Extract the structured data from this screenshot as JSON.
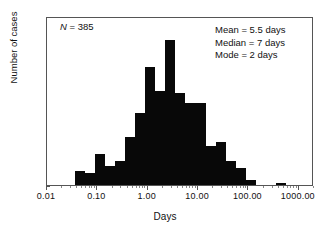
{
  "chart_data": {
    "type": "bar",
    "title": "",
    "subtitle": "",
    "xlabel": "Days",
    "ylabel": "Number of cases",
    "xscale": "log",
    "xlim": [
      0.01,
      2000
    ],
    "ylim": [
      0,
      70
    ],
    "grid": false,
    "legend": null,
    "bar_color": "#080808",
    "x_tick_labels": [
      "0.01",
      "0.10",
      "1.00",
      "10.00",
      "100.00",
      "1000.00"
    ],
    "x_tick_values": [
      0.01,
      0.1,
      1,
      10,
      100,
      1000
    ],
    "y_tick_labels": [
      "0",
      "10",
      "20",
      "30",
      "40",
      "50",
      "60",
      "70"
    ],
    "y_tick_values": [
      0,
      10,
      20,
      30,
      40,
      50,
      60,
      70
    ],
    "bin_edges_days": [
      0.0355,
      0.056,
      0.089,
      0.141,
      0.224,
      0.355,
      0.562,
      0.891,
      1.41,
      2.24,
      3.55,
      5.62,
      8.91,
      14.1,
      22.4,
      35.5,
      56.2,
      89.1,
      141,
      224,
      355,
      562,
      891,
      1410
    ],
    "values": [
      6,
      5,
      13,
      8,
      10,
      20,
      30,
      49,
      39,
      60,
      38,
      34,
      34,
      16,
      18,
      10,
      7,
      2,
      0,
      0,
      1
    ],
    "categories": [
      "0.036-0.056",
      "0.056-0.089",
      "0.089-0.141",
      "0.141-0.224",
      "0.224-0.355",
      "0.355-0.562",
      "0.562-0.891",
      "0.891-1.41",
      "1.41-2.24",
      "2.24-3.55",
      "3.55-5.62",
      "5.62-8.91",
      "8.91-14.1",
      "14.1-22.4",
      "22.4-35.5",
      "35.5-56.2",
      "56.2-89.1",
      "89.1-141",
      "141-224",
      "224-355",
      "355-562"
    ],
    "annotations": [
      {
        "id": "sample-size",
        "text": "N = 385"
      },
      {
        "id": "mean",
        "text": "Mean = 5.5 days"
      },
      {
        "id": "median",
        "text": "Median = 7 days"
      },
      {
        "id": "mode",
        "text": "Mode = 2 days"
      }
    ]
  },
  "annotations": {
    "n_symbol": "N",
    "n_value": " = 385",
    "mean": "Mean = 5.5 days",
    "median": "Median = 7 days",
    "mode": "Mode = 2 days"
  },
  "axes": {
    "x_title": "Days",
    "y_title": "Number of cases"
  }
}
